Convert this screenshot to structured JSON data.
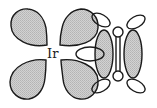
{
  "diagram": {
    "type": "orbital-interaction",
    "metal_label": "Ir",
    "colors": {
      "outline": "#1a1a1a",
      "shaded_fill": "#c8c8c8",
      "unshaded_fill": "#ffffff",
      "background": "#ffffff"
    },
    "components": [
      {
        "name": "metal-d-orbital",
        "description": "four-lobed d orbital centered on Ir"
      },
      {
        "name": "ligand-pi-orbitals",
        "description": "two shaded p lobes of C=C pi bond"
      },
      {
        "name": "substituent-orbitals",
        "description": "small unshaded lobes and carbon atoms"
      }
    ]
  }
}
